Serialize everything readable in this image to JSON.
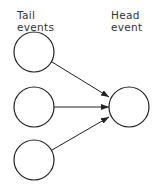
{
  "labels": {
    "tail_line1": "Tail",
    "tail_line2": "events",
    "head_line1": "Head",
    "head_line2": "event"
  },
  "nodes": [
    {
      "id": "tail-1",
      "cx": 34,
      "cy": 52,
      "r": 20
    },
    {
      "id": "tail-2",
      "cx": 34,
      "cy": 107,
      "r": 20
    },
    {
      "id": "tail-3",
      "cx": 34,
      "cy": 160,
      "r": 20
    },
    {
      "id": "head",
      "cx": 129,
      "cy": 107,
      "r": 20
    }
  ],
  "colors": {
    "stroke": "#222222",
    "text": "#333333"
  }
}
